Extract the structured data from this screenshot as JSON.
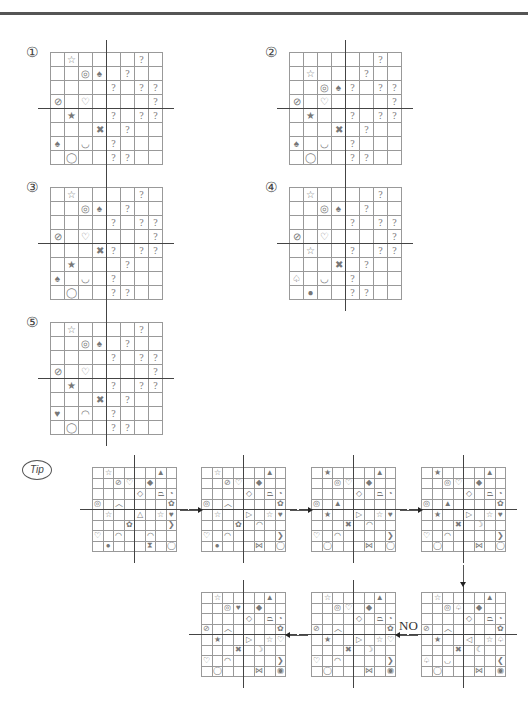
{
  "problems": [
    {
      "label": "①",
      "grid": [
        [
          "",
          "☆",
          "",
          "",
          "",
          "",
          "?",
          ""
        ],
        [
          "",
          "",
          "◎",
          "♠",
          "",
          "?",
          "",
          ""
        ],
        [
          "",
          "",
          "",
          "",
          "?",
          "",
          "?",
          "?"
        ],
        [
          "⊘",
          "",
          "♡",
          "",
          "",
          "",
          "",
          "?"
        ],
        [
          "",
          "★",
          "",
          "",
          "?",
          "",
          "?",
          "?"
        ],
        [
          "",
          "",
          "",
          "✖",
          "",
          "?",
          "",
          ""
        ],
        [
          "♠",
          "",
          "◡",
          "",
          "?",
          "",
          "",
          ""
        ],
        [
          "",
          "◯",
          "",
          "",
          "?",
          "?",
          "",
          ""
        ]
      ]
    },
    {
      "label": "②",
      "grid": [
        [
          "",
          "",
          "",
          "",
          "",
          "",
          "?",
          ""
        ],
        [
          "",
          "☆",
          "",
          "",
          "",
          "?",
          "",
          ""
        ],
        [
          "",
          "",
          "◎",
          "♠",
          "?",
          "",
          "?",
          "?"
        ],
        [
          "⊘",
          "",
          "♡",
          "",
          "",
          "",
          "",
          "?"
        ],
        [
          "",
          "★",
          "",
          "",
          "?",
          "",
          "?",
          "?"
        ],
        [
          "",
          "",
          "",
          "✖",
          "",
          "?",
          "",
          ""
        ],
        [
          "♠",
          "",
          "◡",
          "",
          "?",
          "",
          "",
          ""
        ],
        [
          "",
          "◯",
          "",
          "",
          "?",
          "?",
          "",
          ""
        ]
      ]
    },
    {
      "label": "③",
      "grid": [
        [
          "",
          "☆",
          "",
          "",
          "",
          "",
          "?",
          ""
        ],
        [
          "",
          "",
          "◎",
          "♠",
          "",
          "?",
          "",
          ""
        ],
        [
          "",
          "",
          "",
          "",
          "?",
          "",
          "?",
          "?"
        ],
        [
          "⊘",
          "",
          "♡",
          "",
          "",
          "",
          "",
          "?"
        ],
        [
          "",
          "",
          "",
          "✖",
          "?",
          "",
          "?",
          "?"
        ],
        [
          "",
          "★",
          "",
          "",
          "",
          "?",
          "",
          ""
        ],
        [
          "♠",
          "",
          "◡",
          "",
          "?",
          "",
          "",
          ""
        ],
        [
          "",
          "◯",
          "",
          "",
          "?",
          "?",
          "",
          ""
        ]
      ]
    },
    {
      "label": "④",
      "grid": [
        [
          "",
          "☆",
          "",
          "",
          "",
          "",
          "?",
          ""
        ],
        [
          "",
          "",
          "◎",
          "♠",
          "",
          "?",
          "",
          ""
        ],
        [
          "",
          "",
          "",
          "",
          "?",
          "",
          "?",
          "?"
        ],
        [
          "⊘",
          "",
          "♡",
          "",
          "",
          "",
          "",
          "?"
        ],
        [
          "",
          "☆",
          "",
          "",
          "?",
          "",
          "?",
          "?"
        ],
        [
          "",
          "",
          "",
          "✖",
          "",
          "?",
          "",
          ""
        ],
        [
          "♤",
          "",
          "◡",
          "",
          "?",
          "",
          "",
          ""
        ],
        [
          "",
          "●",
          "",
          "",
          "?",
          "?",
          "",
          ""
        ]
      ]
    },
    {
      "label": "⑤",
      "grid": [
        [
          "",
          "☆",
          "",
          "",
          "",
          "",
          "?",
          ""
        ],
        [
          "",
          "",
          "◎",
          "♠",
          "",
          "?",
          "",
          ""
        ],
        [
          "",
          "",
          "",
          "",
          "?",
          "",
          "?",
          "?"
        ],
        [
          "⊘",
          "",
          "♡",
          "",
          "",
          "",
          "",
          "?"
        ],
        [
          "",
          "★",
          "",
          "",
          "?",
          "",
          "?",
          "?"
        ],
        [
          "",
          "",
          "",
          "✖",
          "",
          "?",
          "",
          ""
        ],
        [
          "♥",
          "",
          "◠",
          "",
          "?",
          "",
          "",
          ""
        ],
        [
          "",
          "◯",
          "",
          "",
          "?",
          "?",
          "",
          ""
        ]
      ]
    }
  ],
  "tip": {
    "label": "Tip",
    "no_label": "NO",
    "grids": [
      [
        [
          "",
          "☆",
          "",
          "",
          "",
          "",
          "▲",
          ""
        ],
        [
          "",
          "",
          "⊘",
          "♡",
          "",
          "◆",
          "",
          ""
        ],
        [
          "",
          "",
          "",
          "",
          "◇",
          "",
          "⏢",
          "◔"
        ],
        [
          "◎",
          "",
          "︿",
          "",
          "",
          "",
          "",
          "✿"
        ],
        [
          "",
          "☆",
          "",
          "",
          "△",
          "",
          "☆",
          "♥"
        ],
        [
          "",
          "",
          "",
          "✿",
          "",
          "",
          "",
          "❯"
        ],
        [
          "♡",
          "",
          "◠",
          "",
          "",
          "◠",
          "",
          ""
        ],
        [
          "",
          "●",
          "",
          "",
          "",
          "⧗",
          "",
          "◯"
        ]
      ],
      [
        [
          "",
          "☆",
          "",
          "",
          "",
          "",
          "▲",
          ""
        ],
        [
          "",
          "",
          "⊘",
          "♡",
          "",
          "◆",
          "",
          ""
        ],
        [
          "",
          "",
          "",
          "",
          "◇",
          "",
          "⏢",
          "◔"
        ],
        [
          "◎",
          "",
          "︿",
          "",
          "",
          "",
          "",
          "✿"
        ],
        [
          "",
          "☆",
          "",
          "",
          "▷",
          "",
          "☆",
          "♥"
        ],
        [
          "",
          "",
          "",
          "✿",
          "",
          "◠",
          "",
          ""
        ],
        [
          "♡",
          "",
          "◠",
          "",
          "",
          "",
          "",
          "❯"
        ],
        [
          "",
          "●",
          "",
          "",
          "",
          "⋈",
          "",
          "◯"
        ]
      ],
      [
        [
          "",
          "★",
          "",
          "",
          "",
          "",
          "▲",
          ""
        ],
        [
          "",
          "",
          "◎",
          "♡",
          "",
          "◆",
          "",
          ""
        ],
        [
          "",
          "",
          "",
          "",
          "◇",
          "",
          "⏢",
          "◔"
        ],
        [
          "◎",
          "",
          "▲",
          "",
          "",
          "",
          "",
          ""
        ],
        [
          "",
          "★",
          "",
          "",
          "▷",
          "",
          "☆",
          "♥"
        ],
        [
          "",
          "",
          "",
          "✖",
          "",
          "◠",
          "",
          ""
        ],
        [
          "♡",
          "",
          "◠",
          "",
          "",
          "",
          "",
          "❯"
        ],
        [
          "",
          "◯",
          "",
          "",
          "",
          "⋈",
          "",
          "◯"
        ]
      ],
      [
        [
          "",
          "★",
          "",
          "",
          "",
          "",
          "▲",
          ""
        ],
        [
          "",
          "",
          "◎",
          "♡",
          "",
          "◆",
          "",
          ""
        ],
        [
          "",
          "",
          "",
          "",
          "◇",
          "",
          "⏢",
          "◔"
        ],
        [
          "◎",
          "",
          "▲",
          "",
          "",
          "",
          "",
          "✿"
        ],
        [
          "",
          "★",
          "",
          "",
          "▷",
          "",
          "☆",
          "♥"
        ],
        [
          "",
          "",
          "",
          "✖",
          "",
          "☽",
          "",
          ""
        ],
        [
          "♡",
          "",
          "◠",
          "",
          "",
          "",
          "",
          "❯"
        ],
        [
          "",
          "◯",
          "",
          "",
          "",
          "⋈",
          "",
          "◯"
        ]
      ],
      [
        [
          "",
          "☆",
          "",
          "",
          "",
          "",
          "▲",
          ""
        ],
        [
          "",
          "",
          "◎",
          "♤",
          "",
          "◆",
          "",
          ""
        ],
        [
          "",
          "",
          "",
          "",
          "◇",
          "",
          "⏢",
          "◔"
        ],
        [
          "⊘",
          "",
          "︿",
          "",
          "",
          "",
          "",
          "✿"
        ],
        [
          "",
          "★",
          "",
          "",
          "◁",
          "",
          "☆",
          "♤"
        ],
        [
          "",
          "",
          "",
          "✖",
          "",
          "☾",
          "",
          ""
        ],
        [
          "♤",
          "",
          "◡",
          "",
          "",
          "",
          "",
          "❮"
        ],
        [
          "",
          "◯",
          "",
          "",
          "",
          "⋈",
          "",
          "◉"
        ]
      ],
      [
        [
          "",
          "☆",
          "",
          "",
          "",
          "",
          "▲",
          ""
        ],
        [
          "",
          "",
          "◎",
          "♡",
          "",
          "◆",
          "",
          ""
        ],
        [
          "",
          "",
          "",
          "",
          "◇",
          "",
          "⏢",
          "◔"
        ],
        [
          "⊘",
          "",
          "︿",
          "",
          "",
          "",
          "",
          "✿"
        ],
        [
          "",
          "★",
          "",
          "",
          "▷",
          "",
          "☆",
          "♡"
        ],
        [
          "",
          "",
          "",
          "✖",
          "",
          "☽",
          "",
          ""
        ],
        [
          "♡",
          "",
          "◠",
          "",
          "",
          "",
          "",
          "❯"
        ],
        [
          "",
          "◯",
          "",
          "",
          "",
          "⋈",
          "",
          "◉"
        ]
      ],
      [
        [
          "",
          "☆",
          "",
          "",
          "",
          "",
          "▲",
          ""
        ],
        [
          "",
          "",
          "◎",
          "♥",
          "",
          "◆",
          "",
          ""
        ],
        [
          "",
          "",
          "",
          "",
          "◇",
          "",
          "⏢",
          "◔"
        ],
        [
          "⊘",
          "",
          "︿",
          "",
          "",
          "",
          "",
          "✿"
        ],
        [
          "",
          "★",
          "",
          "",
          "▷",
          "",
          "☆",
          "♡"
        ],
        [
          "",
          "",
          "",
          "✖",
          "",
          "☽",
          "",
          ""
        ],
        [
          "♡",
          "",
          "◠",
          "",
          "",
          "",
          "",
          "❯"
        ],
        [
          "",
          "◯",
          "",
          "",
          "",
          "⋈",
          "",
          "◉"
        ]
      ]
    ]
  }
}
